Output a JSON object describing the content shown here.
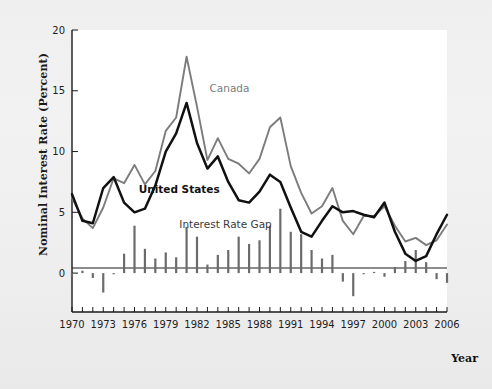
{
  "chart_data": {
    "type": "line",
    "title": "",
    "xlabel": "Year",
    "ylabel": "Nominal Interest Rate (Percent)",
    "xlim": [
      1970,
      2006
    ],
    "ylim": [
      -3.2,
      20
    ],
    "yticks": [
      0,
      5,
      10,
      15,
      20
    ],
    "ytick_labels": [
      "0",
      "5",
      "10",
      "15",
      "20"
    ],
    "xticks": [
      1970,
      1971,
      1972,
      1973,
      1974,
      1975,
      1976,
      1977,
      1978,
      1979,
      1980,
      1981,
      1982,
      1983,
      1984,
      1985,
      1986,
      1987,
      1988,
      1989,
      1990,
      1991,
      1992,
      1993,
      1994,
      1995,
      1996,
      1997,
      1998,
      1999,
      2000,
      2001,
      2002,
      2003,
      2004,
      2005,
      2006
    ],
    "xtick_labels": [
      "1970",
      "1973",
      "1976",
      "1979",
      "1982",
      "1985",
      "1988",
      "1991",
      "1994",
      "1997",
      "2000",
      "2003",
      "2006"
    ],
    "xtick_labelled_values": [
      1970,
      1973,
      1976,
      1979,
      1982,
      1985,
      1988,
      1991,
      1994,
      1997,
      2000,
      2003,
      2006
    ],
    "grid": false,
    "legend_position": "inline-annotations",
    "x": [
      1970,
      1971,
      1972,
      1973,
      1974,
      1975,
      1976,
      1977,
      1978,
      1979,
      1980,
      1981,
      1982,
      1983,
      1984,
      1985,
      1986,
      1987,
      1988,
      1989,
      1990,
      1991,
      1992,
      1993,
      1994,
      1995,
      1996,
      1997,
      1998,
      1999,
      2000,
      2001,
      2002,
      2003,
      2004,
      2005,
      2006
    ],
    "series": [
      {
        "name": "Canada",
        "color": "#7c7c7c",
        "width": 1.9,
        "values": [
          6.2,
          4.5,
          3.7,
          5.4,
          7.8,
          7.4,
          8.9,
          7.3,
          8.4,
          11.7,
          12.8,
          17.8,
          13.7,
          9.3,
          11.1,
          9.4,
          9.0,
          8.2,
          9.4,
          12.0,
          12.8,
          8.8,
          6.6,
          4.9,
          5.5,
          7.0,
          4.3,
          3.2,
          4.7,
          4.7,
          5.5,
          3.9,
          2.6,
          2.9,
          2.3,
          2.7,
          4.0
        ]
      },
      {
        "name": "United States",
        "color": "#111111",
        "width": 2.5,
        "values": [
          6.5,
          4.3,
          4.1,
          7.0,
          7.9,
          5.8,
          5.0,
          5.3,
          7.2,
          10.0,
          11.5,
          14.0,
          10.7,
          8.6,
          9.6,
          7.5,
          6.0,
          5.8,
          6.7,
          8.1,
          7.5,
          5.4,
          3.4,
          3.0,
          4.3,
          5.5,
          5.0,
          5.1,
          4.8,
          4.6,
          5.8,
          3.4,
          1.6,
          1.0,
          1.4,
          3.2,
          4.8
        ]
      }
    ],
    "bars": {
      "name": "Interest Rate Gap",
      "color": "#6b6b6b",
      "width": 2.2,
      "values": [
        -0.3,
        0.2,
        -0.4,
        -1.6,
        -0.1,
        1.6,
        3.9,
        2.0,
        1.2,
        1.7,
        1.3,
        3.8,
        3.0,
        0.7,
        1.5,
        1.9,
        3.0,
        2.4,
        2.7,
        3.9,
        5.3,
        3.4,
        3.2,
        1.9,
        1.2,
        1.5,
        -0.7,
        -1.9,
        -0.1,
        0.1,
        -0.3,
        0.5,
        1.0,
        1.9,
        0.9,
        -0.5,
        -0.8
      ]
    },
    "annotations": [
      {
        "name": "canada-label",
        "text": "Canada",
        "x": 1983.2,
        "y": 14.9,
        "style": "canada"
      },
      {
        "name": "united-states-label",
        "text": "United States",
        "x": 1976.4,
        "y": 6.6,
        "style": "us"
      },
      {
        "name": "interest-rate-gap-label",
        "text": "Interest Rate Gap",
        "x": 1980.3,
        "y": 3.7,
        "style": "gap"
      }
    ]
  }
}
